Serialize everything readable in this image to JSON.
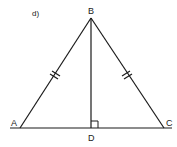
{
  "figure": {
    "part_label": "d)",
    "shape": "isosceles triangle with altitude",
    "stroke_color": "#1a1a1a",
    "background_color": "#ffffff"
  },
  "points": {
    "A": {
      "label": "A",
      "x": 20,
      "y": 128
    },
    "B": {
      "label": "B",
      "x": 91,
      "y": 18
    },
    "C": {
      "label": "C",
      "x": 164,
      "y": 128
    },
    "D": {
      "label": "D",
      "x": 91,
      "y": 128
    }
  },
  "segments": [
    {
      "name": "AB",
      "from": "A",
      "to": "B",
      "tick_marks": 1
    },
    {
      "name": "BC",
      "from": "B",
      "to": "C",
      "tick_marks": 1
    },
    {
      "name": "BD",
      "from": "B",
      "to": "D",
      "tick_marks": 0
    },
    {
      "name": "baseline",
      "from": "A",
      "to": "C",
      "extended": true,
      "tick_marks": 0
    }
  ],
  "annotations": {
    "right_angle_at": "D",
    "congruent_sides": [
      "AB",
      "BC"
    ]
  }
}
